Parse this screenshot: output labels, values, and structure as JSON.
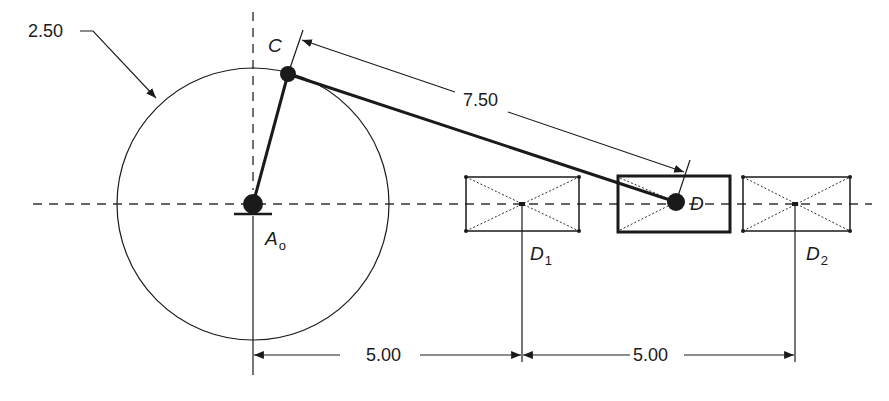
{
  "diagram": {
    "type": "slider-crank mechanism",
    "labels": {
      "crank_radius": "2.50",
      "coupler_length": "7.50",
      "dim_left": "5.00",
      "dim_right": "5.00",
      "point_c": "C",
      "point_d": "D",
      "pivot_base": "A",
      "pivot_sub": "o",
      "d1_base": "D",
      "d1_sub": "1",
      "d2_base": "D",
      "d2_sub": "2"
    },
    "colors": {
      "stroke": "#1a1a1a",
      "background": "#ffffff"
    }
  }
}
